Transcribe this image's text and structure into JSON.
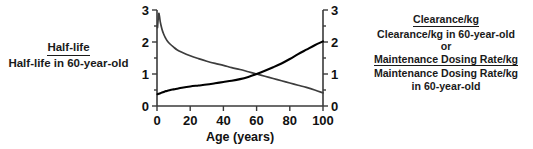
{
  "left_label": {
    "numerator": "Half-life",
    "denominator": "Half-life in 60-year-old"
  },
  "right_label": {
    "numerator_1": "Clearance/kg",
    "denominator_1": "Clearance/kg in 60-year-old",
    "joiner": "or",
    "numerator_2": "Maintenance Dosing Rate/kg",
    "denominator_2a": "Maintenance Dosing Rate/kg",
    "denominator_2b": "in 60-year-old"
  },
  "chart_data": {
    "type": "line",
    "title": "",
    "xlabel": "Age (years)",
    "ylabel": "",
    "xlim": [
      0,
      100
    ],
    "ylim": [
      0,
      3
    ],
    "xticks": [
      "0",
      "20",
      "40",
      "60",
      "80",
      "100"
    ],
    "xtick_values": [
      0,
      20,
      40,
      60,
      80,
      100
    ],
    "yticks_left": [
      "0",
      "1",
      "2",
      "3"
    ],
    "yticks_right": [
      "0",
      "1",
      "2",
      "3"
    ],
    "ytick_values": [
      0,
      1,
      2,
      3
    ],
    "grid": false,
    "legend": "none",
    "series": [
      {
        "name": "Half-life ratio",
        "color": "#3d3d3d",
        "x": [
          0.3,
          1,
          1.5,
          2,
          3,
          4,
          5,
          6,
          8,
          10,
          12,
          15,
          20,
          25,
          30,
          35,
          40,
          45,
          50,
          55,
          60,
          65,
          70,
          75,
          80,
          85,
          90,
          95,
          100
        ],
        "y": [
          2.45,
          2.88,
          2.8,
          2.62,
          2.4,
          2.25,
          2.14,
          2.05,
          1.93,
          1.84,
          1.76,
          1.68,
          1.57,
          1.48,
          1.4,
          1.33,
          1.27,
          1.2,
          1.14,
          1.07,
          1.0,
          0.93,
          0.86,
          0.79,
          0.72,
          0.65,
          0.58,
          0.5,
          0.41
        ]
      },
      {
        "name": "Clearance/kg ratio (or Maintenance Dosing Rate/kg ratio)",
        "color": "#000000",
        "x": [
          0.3,
          1,
          2,
          3,
          4,
          5,
          6,
          8,
          10,
          12,
          15,
          20,
          25,
          30,
          35,
          40,
          45,
          50,
          55,
          60,
          65,
          70,
          75,
          80,
          85,
          90,
          95,
          100
        ],
        "y": [
          0.37,
          0.38,
          0.4,
          0.42,
          0.44,
          0.46,
          0.47,
          0.5,
          0.52,
          0.54,
          0.57,
          0.61,
          0.64,
          0.67,
          0.71,
          0.75,
          0.79,
          0.84,
          0.91,
          1.0,
          1.1,
          1.21,
          1.33,
          1.47,
          1.62,
          1.76,
          1.9,
          2.02
        ]
      }
    ]
  }
}
